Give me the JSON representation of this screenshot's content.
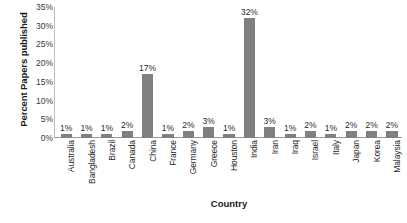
{
  "chart_data": {
    "type": "bar",
    "title": "",
    "xlabel": "Country",
    "ylabel": "Percent Papers published",
    "ylim": [
      0,
      35
    ],
    "ytick_labels": [
      "0%",
      "5%",
      "10%",
      "15%",
      "20%",
      "25%",
      "30%",
      "35%"
    ],
    "ytick_values": [
      0,
      5,
      10,
      15,
      20,
      25,
      30,
      35
    ],
    "grid": false,
    "legend": "none",
    "bar_color": "#808080",
    "categories": [
      "Australia",
      "Bangladesh",
      "Brazil",
      "Canada",
      "China",
      "France",
      "Germany",
      "Greece",
      "Houston",
      "India",
      "Iran",
      "Iraq",
      "Israel",
      "Italy",
      "Japan",
      "Korea",
      "Malaysia"
    ],
    "values": [
      1,
      1,
      1,
      2,
      17,
      1,
      2,
      3,
      1,
      32,
      3,
      1,
      2,
      1,
      2,
      2,
      2
    ],
    "data_labels": [
      "1%",
      "1%",
      "1%",
      "2%",
      "17%",
      "1%",
      "2%",
      "3%",
      "1%",
      "32%",
      "3%",
      "1%",
      "2%",
      "1%",
      "2%",
      "2%",
      "2%"
    ]
  }
}
